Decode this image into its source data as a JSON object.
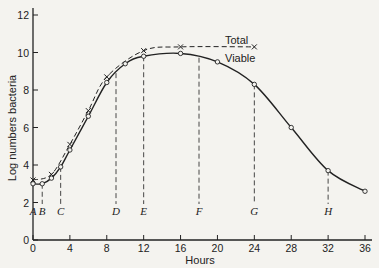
{
  "chart_data": {
    "type": "line",
    "title": "",
    "xlabel": "Hours",
    "ylabel": "Log numbers bacteria",
    "xlim": [
      0,
      36
    ],
    "ylim": [
      0,
      12
    ],
    "x_ticks": [
      "0",
      "4",
      "8",
      "12",
      "16",
      "20",
      "24",
      "28",
      "32",
      "36"
    ],
    "y_ticks": [
      "0",
      "2",
      "4",
      "6",
      "8",
      "10",
      "12"
    ],
    "grid": false,
    "series": [
      {
        "name": "Total",
        "style": "dashed",
        "marker": "x",
        "x": [
          0,
          2,
          4,
          6,
          8,
          12,
          16,
          24
        ],
        "y": [
          3.2,
          3.5,
          5.1,
          6.9,
          8.7,
          10.1,
          10.3,
          10.3
        ]
      },
      {
        "name": "Viable",
        "style": "solid",
        "marker": "o",
        "x": [
          0,
          1,
          2,
          3,
          4,
          6,
          8,
          10,
          12,
          16,
          20,
          24,
          28,
          32,
          36
        ],
        "y": [
          3.0,
          3.0,
          3.3,
          3.9,
          4.8,
          6.6,
          8.4,
          9.4,
          9.8,
          9.95,
          9.5,
          8.3,
          6.0,
          3.7,
          2.6
        ]
      }
    ],
    "annotations": [
      {
        "label": "A",
        "x": 0
      },
      {
        "label": "B",
        "x": 1
      },
      {
        "label": "C",
        "x": 3
      },
      {
        "label": "D",
        "x": 9
      },
      {
        "label": "E",
        "x": 12
      },
      {
        "label": "F",
        "x": 18
      },
      {
        "label": "G",
        "x": 24
      },
      {
        "label": "H",
        "x": 32
      }
    ],
    "legend": {
      "total_label": "Total",
      "viable_label": "Viable"
    }
  }
}
